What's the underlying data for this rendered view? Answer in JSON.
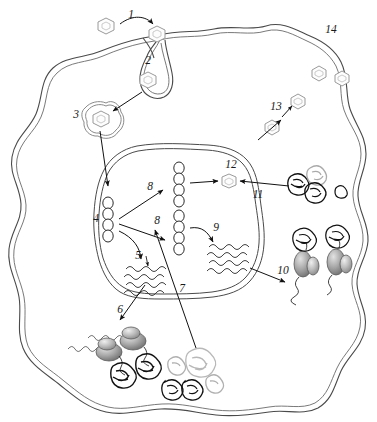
{
  "figure": {
    "type": "biology-diagram",
    "width": 377,
    "height": 422,
    "background_color": "#ffffff",
    "line_color": "#4a4a4a"
  },
  "labels": [
    {
      "id": "1",
      "text": "1",
      "x": 131,
      "y": 18,
      "describes": "virus-attachment-to-cell-membrane"
    },
    {
      "id": "2",
      "text": "2",
      "x": 148,
      "y": 64,
      "describes": "endocytosis-vesicle-engulfing-virus"
    },
    {
      "id": "3",
      "text": "3",
      "x": 76,
      "y": 118,
      "describes": "endosome-containing-virion"
    },
    {
      "id": "4",
      "text": "4",
      "x": 96,
      "y": 222,
      "describes": "viral-genome-template-in-nucleus"
    },
    {
      "id": "5",
      "text": "5",
      "x": 138,
      "y": 259,
      "describes": "transcription-to-messenger-rna"
    },
    {
      "id": "6",
      "text": "6",
      "x": 120,
      "y": 313,
      "describes": "mrna-export-to-cytoplasm-translation"
    },
    {
      "id": "7",
      "text": "7",
      "x": 182,
      "y": 292,
      "describes": "viral-protein-import-to-nucleus"
    },
    {
      "id": "8a",
      "text": "8",
      "x": 150,
      "y": 190,
      "describes": "genome-replication-upper"
    },
    {
      "id": "8b",
      "text": "8",
      "x": 157,
      "y": 224,
      "describes": "genome-replication-lower"
    },
    {
      "id": "9",
      "text": "9",
      "x": 216,
      "y": 231,
      "describes": "viral-rna-synthesis"
    },
    {
      "id": "10",
      "text": "10",
      "x": 283,
      "y": 274,
      "describes": "nuclear-export-of-progeny-genomes"
    },
    {
      "id": "11",
      "text": "11",
      "x": 258,
      "y": 198,
      "describes": "capsid-protein-entering-nucleus"
    },
    {
      "id": "12",
      "text": "12",
      "x": 231,
      "y": 168,
      "describes": "assembled-nucleocapsid-in-nucleus"
    },
    {
      "id": "13",
      "text": "13",
      "x": 276,
      "y": 110,
      "describes": "budding-virion-exiting-cell"
    },
    {
      "id": "14",
      "text": "14",
      "x": 331,
      "y": 33,
      "describes": "released-mature-virions"
    }
  ],
  "structures": {
    "cell_membrane": "wavy-double-lipid-bilayer-outline",
    "nuclear_envelope": "rounded-polygon-double-membrane",
    "virion_shape": "hexagon-with-inner-hexagon",
    "chromatin": "vertical-chain-of-open-beads",
    "rna": "stack-of-wavy-lines",
    "ribosome": "two-lobed-gray-ellipse",
    "protein_aggregate": "tangled-scribble-blob"
  },
  "virions": [
    {
      "name": "free-virion-extracellular",
      "x": 106,
      "y": 26,
      "scale": 1.0,
      "tone": "light"
    },
    {
      "name": "virion-bound-to-membrane",
      "x": 157,
      "y": 34,
      "scale": 1.0,
      "tone": "light"
    },
    {
      "name": "virion-in-endocytic-pit",
      "x": 148,
      "y": 80,
      "scale": 0.95,
      "tone": "light"
    },
    {
      "name": "virion-in-endosome",
      "x": 97,
      "y": 119,
      "scale": 1.0,
      "tone": "light"
    },
    {
      "name": "virion-in-nucleus-12",
      "x": 229,
      "y": 181,
      "scale": 0.88,
      "tone": "light"
    },
    {
      "name": "virion-exiting-13",
      "x": 272,
      "y": 127,
      "scale": 0.9,
      "tone": "light"
    },
    {
      "name": "virion-crossing-membrane",
      "x": 298,
      "y": 101,
      "scale": 0.9,
      "tone": "light"
    },
    {
      "name": "virion-released-14a",
      "x": 319,
      "y": 73,
      "scale": 0.9,
      "tone": "light"
    },
    {
      "name": "virion-released-14b",
      "x": 339,
      "y": 78,
      "scale": 0.9,
      "tone": "light"
    }
  ],
  "chromatin_chains": [
    {
      "name": "template-genome-4",
      "x": 106,
      "y": 202,
      "beads": 5
    },
    {
      "name": "progeny-genome-upper",
      "x": 178,
      "y": 165,
      "beads": 5
    },
    {
      "name": "progeny-genome-lower",
      "x": 178,
      "y": 220,
      "beads": 5
    }
  ],
  "rna_clusters": [
    {
      "name": "mrna-cluster-5",
      "x": 129,
      "y": 272,
      "lines": 4
    },
    {
      "name": "viral-rna-cluster-9",
      "x": 212,
      "y": 251,
      "lines": 4
    }
  ],
  "ribosomes": [
    {
      "name": "ribosome-translating-a",
      "x": 108,
      "y": 348
    },
    {
      "name": "ribosome-translating-b",
      "x": 132,
      "y": 337
    },
    {
      "name": "ribosome-assembling-c",
      "x": 305,
      "y": 262
    },
    {
      "name": "ribosome-assembling-d",
      "x": 337,
      "y": 260
    }
  ],
  "protein_aggregates": [
    {
      "name": "capsid-protein-dark-a",
      "x": 298,
      "y": 184,
      "tone": "dark"
    },
    {
      "name": "capsid-protein-gray-b",
      "x": 316,
      "y": 176,
      "tone": "gray"
    },
    {
      "name": "capsid-protein-dark-c",
      "x": 315,
      "y": 192,
      "tone": "dark"
    },
    {
      "name": "capsid-protein-dark-d",
      "x": 341,
      "y": 191,
      "tone": "dark"
    },
    {
      "name": "folded-protein-a",
      "x": 122,
      "y": 374,
      "tone": "dark"
    },
    {
      "name": "folded-protein-b",
      "x": 146,
      "y": 365,
      "tone": "dark"
    },
    {
      "name": "misfolded-protein-gray-a",
      "x": 177,
      "y": 366,
      "tone": "gray"
    },
    {
      "name": "misfolded-protein-gray-b",
      "x": 201,
      "y": 362,
      "tone": "gray"
    },
    {
      "name": "degraded-protein-a",
      "x": 172,
      "y": 389,
      "tone": "dark"
    },
    {
      "name": "degraded-protein-b",
      "x": 192,
      "y": 389,
      "tone": "dark"
    },
    {
      "name": "degraded-protein-gray",
      "x": 213,
      "y": 385,
      "tone": "gray"
    },
    {
      "name": "nascent-protein-c",
      "x": 304,
      "y": 238,
      "tone": "dark"
    },
    {
      "name": "nascent-protein-d",
      "x": 336,
      "y": 235,
      "tone": "dark"
    }
  ]
}
